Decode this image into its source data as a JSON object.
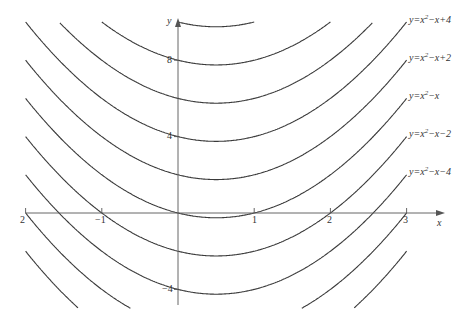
{
  "chart_data": {
    "type": "line",
    "title": "",
    "xlabel": "x",
    "ylabel": "y",
    "family": "y = x^2 - x + C",
    "constants": [
      10,
      8,
      6,
      4,
      2,
      0,
      -2,
      -4,
      -6,
      -8
    ],
    "x_range_plotted": [
      -2,
      3
    ],
    "xlim": [
      -2,
      3.5
    ],
    "ylim": [
      -5,
      10
    ],
    "x_ticks": [
      -2,
      -1,
      1,
      2,
      3
    ],
    "x_tick_labels": [
      "2",
      "−1",
      "1",
      "2",
      "3"
    ],
    "y_ticks": [
      8,
      4,
      -4
    ],
    "y_tick_labels": [
      "8",
      "4",
      "−4"
    ],
    "grid": false,
    "legend": "inline labels at right end of curves",
    "series": [
      {
        "name": "y=x²−x+4",
        "C": 4,
        "labeled": true
      },
      {
        "name": "y=x²−x+2",
        "C": 2,
        "labeled": true
      },
      {
        "name": "y=x²−x",
        "C": 0,
        "labeled": true
      },
      {
        "name": "y=x²−x−2",
        "C": -2,
        "labeled": true
      },
      {
        "name": "y=x²−x−4",
        "C": -4,
        "labeled": true
      }
    ]
  },
  "labels": {
    "x_axis": "x",
    "y_axis": "y",
    "curve_labels": [
      {
        "pre": "y=x",
        "sup": "2",
        "post": "−x+4"
      },
      {
        "pre": "y=x",
        "sup": "2",
        "post": "−x+2"
      },
      {
        "pre": "y=x",
        "sup": "2",
        "post": "−x"
      },
      {
        "pre": "y=x",
        "sup": "2",
        "post": "−x−2"
      },
      {
        "pre": "y=x",
        "sup": "2",
        "post": "−x−4"
      }
    ]
  },
  "colors": {
    "curve": "#3a3a3a",
    "axis": "#555555",
    "text": "#333333"
  }
}
